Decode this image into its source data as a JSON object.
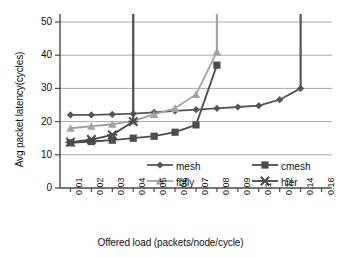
{
  "chart_data": {
    "type": "line",
    "title": "",
    "xlabel": "Offered load (packets/node/cycle)",
    "ylabel": "Avg packet latency(cycles)",
    "categories": [
      "0.01",
      "0.02",
      "0.03",
      "0.04",
      "0.05",
      "0.06",
      "0.07",
      "0.08",
      "0.09",
      "0.1",
      "0.12",
      "0.14",
      "0.16"
    ],
    "xticklabels": [
      "0.01",
      "0.02",
      "0.03",
      "0.04",
      "0.05",
      "0.06",
      "0.07",
      "0.08",
      "0.09",
      "0.1",
      "0.12",
      "0.14",
      "0.16"
    ],
    "yticklabels": [
      "0",
      "10",
      "20",
      "30",
      "40",
      "50"
    ],
    "ytickvalues": [
      0,
      10,
      20,
      30,
      40,
      50
    ],
    "ylim": [
      0,
      56
    ],
    "grid": "horizontal",
    "legend_position": "inside-bottom",
    "series": [
      {
        "name": "mesh",
        "marker": "diamond",
        "color": "#555555",
        "x": [
          "0.01",
          "0.02",
          "0.03",
          "0.04",
          "0.05",
          "0.06",
          "0.07",
          "0.08",
          "0.09",
          "0.1",
          "0.12",
          "0.14"
        ],
        "values": [
          22.0,
          22.0,
          22.2,
          22.4,
          22.8,
          23.2,
          23.6,
          24.0,
          24.4,
          24.8,
          26.6,
          30.0
        ],
        "saturation_x": "0.14",
        "saturates": true
      },
      {
        "name": "cmesh",
        "marker": "square",
        "color": "#4d4d4d",
        "x": [
          "0.01",
          "0.02",
          "0.03",
          "0.04",
          "0.05",
          "0.06",
          "0.07",
          "0.08"
        ],
        "values": [
          13.6,
          14.0,
          14.4,
          15.0,
          15.6,
          16.8,
          19.0,
          37.0
        ],
        "saturation_x": "0.08",
        "saturates": false
      },
      {
        "name": "fbfly",
        "marker": "triangle",
        "color": "#a3a3a3",
        "x": [
          "0.01",
          "0.02",
          "0.03",
          "0.04",
          "0.05",
          "0.06",
          "0.07",
          "0.08"
        ],
        "values": [
          18.0,
          18.6,
          19.2,
          20.2,
          22.2,
          24.0,
          28.2,
          41.0
        ],
        "saturation_x": "0.08",
        "saturates": true
      },
      {
        "name": "hier",
        "marker": "cross",
        "color": "#4a4a4a",
        "x": [
          "0.01",
          "0.02",
          "0.03",
          "0.04"
        ],
        "values": [
          13.8,
          14.6,
          16.0,
          20.0
        ],
        "saturation_x": "0.04",
        "saturates": true
      }
    ],
    "saturation_spikes": [
      {
        "series": "hier",
        "x": "0.04",
        "top": 56
      },
      {
        "series": "fbfly",
        "x": "0.08",
        "top": 56
      },
      {
        "series": "mesh",
        "x": "0.14",
        "top": 56
      }
    ]
  },
  "legend": {
    "entries": [
      {
        "label": "mesh",
        "marker": "diamond-marker-icon"
      },
      {
        "label": "cmesh",
        "marker": "square-marker-icon"
      },
      {
        "label": "fbfly",
        "marker": "triangle-marker-icon"
      },
      {
        "label": "hier",
        "marker": "cross-marker-icon"
      }
    ]
  },
  "colors": {
    "axis": "#4a4a4a",
    "grid": "#a8a8a8",
    "background": "#ffffff",
    "text": "#111111"
  }
}
